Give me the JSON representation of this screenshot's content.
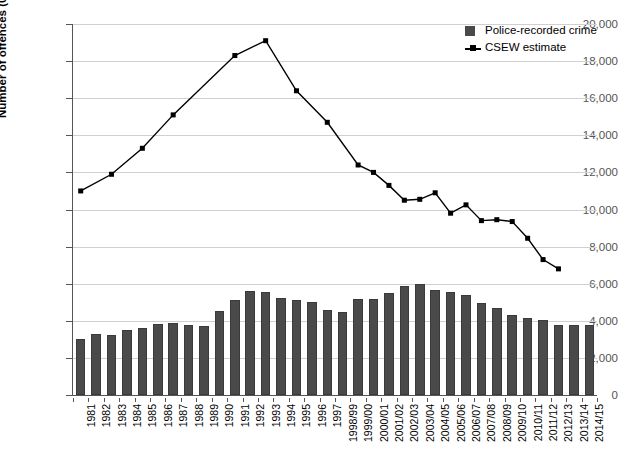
{
  "chart_data": {
    "type": "bar",
    "title": "",
    "subtitle": "",
    "xlabel": "",
    "ylabel": "Number of offences (000s)",
    "ylim": [
      0,
      20000
    ],
    "ytick_values": [
      0,
      2000,
      4000,
      6000,
      8000,
      10000,
      12000,
      14000,
      16000,
      18000,
      20000
    ],
    "ytick_labels": [
      "0",
      "2,000",
      "4,000",
      "6,000",
      "8,000",
      "10,000",
      "12,000",
      "14,000",
      "16,000",
      "18,000",
      "20,000"
    ],
    "grid": true,
    "legend_position": "top-right",
    "categories": [
      "1981",
      "1982",
      "1983",
      "1984",
      "1985",
      "1986",
      "1987",
      "1988",
      "1989",
      "1990",
      "1991",
      "1992",
      "1993",
      "1994",
      "1995",
      "1996",
      "1997",
      "1998/99",
      "1999/00",
      "2000/01",
      "2001/02",
      "2002/03",
      "2003/04",
      "2004/05",
      "2005/06",
      "2006/07",
      "2007/08",
      "2008/09",
      "2009/10",
      "2010/11",
      "2011/12",
      "2012/13",
      "2013/14",
      "2014/15"
    ],
    "series": [
      {
        "name": "Police-recorded crime",
        "type": "bar",
        "color": "#4a4a4a",
        "values": [
          3000,
          3300,
          3250,
          3500,
          3600,
          3850,
          3900,
          3750,
          3700,
          4550,
          5100,
          5600,
          5550,
          5250,
          5100,
          5000,
          4600,
          4500,
          5200,
          5150,
          5500,
          5900,
          6000,
          5650,
          5550,
          5400,
          4950,
          4700,
          4340,
          4150,
          4040,
          3800,
          3750,
          3800
        ]
      },
      {
        "name": "CSEW estimate",
        "type": "line",
        "color": "#000000",
        "marker": "square",
        "points": [
          {
            "category": "1981",
            "value": 11000
          },
          {
            "category": "1983",
            "value": 11900
          },
          {
            "category": "1985",
            "value": 13300
          },
          {
            "category": "1987",
            "value": 15100
          },
          {
            "category": "1991",
            "value": 18300
          },
          {
            "category": "1993",
            "value": 19100
          },
          {
            "category": "1995",
            "value": 16400
          },
          {
            "category": "1997",
            "value": 14700
          },
          {
            "category": "1999/00",
            "value": 12400
          },
          {
            "category": "2000/01",
            "value": 12000
          },
          {
            "category": "2001/02",
            "value": 11300
          },
          {
            "category": "2002/03",
            "value": 10500
          },
          {
            "category": "2003/04",
            "value": 10550
          },
          {
            "category": "2004/05",
            "value": 10900
          },
          {
            "category": "2005/06",
            "value": 9800
          },
          {
            "category": "2006/07",
            "value": 10250
          },
          {
            "category": "2007/08",
            "value": 9400
          },
          {
            "category": "2008/09",
            "value": 9450
          },
          {
            "category": "2009/10",
            "value": 9350
          },
          {
            "category": "2010/11",
            "value": 8450
          },
          {
            "category": "2011/12",
            "value": 7300
          },
          {
            "category": "2012/13",
            "value": 6800
          }
        ]
      }
    ]
  },
  "legend": {
    "items": [
      {
        "label": "Police-recorded crime",
        "marker": "square-swatch"
      },
      {
        "label": "CSEW estimate",
        "marker": "line-with-square"
      }
    ]
  },
  "axis": {
    "y_title": "Number of offences (000s)"
  }
}
